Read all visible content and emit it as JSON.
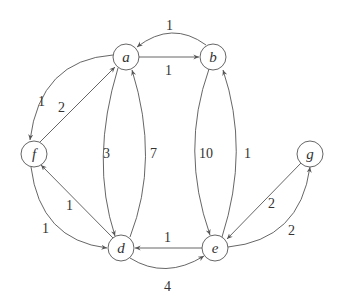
{
  "graph": {
    "type": "directed-weighted",
    "nodes": [
      {
        "id": "a",
        "label": "a",
        "x": 126,
        "y": 57
      },
      {
        "id": "b",
        "label": "b",
        "x": 213,
        "y": 57
      },
      {
        "id": "f",
        "label": "f",
        "x": 34,
        "y": 154
      },
      {
        "id": "g",
        "label": "g",
        "x": 310,
        "y": 154
      },
      {
        "id": "d",
        "label": "d",
        "x": 121,
        "y": 248
      },
      {
        "id": "e",
        "label": "e",
        "x": 215,
        "y": 248
      }
    ],
    "edges": [
      {
        "from": "b",
        "to": "a",
        "weight": "1"
      },
      {
        "from": "a",
        "to": "b",
        "weight": "1"
      },
      {
        "from": "a",
        "to": "f",
        "weight": "1"
      },
      {
        "from": "f",
        "to": "a",
        "weight": "2"
      },
      {
        "from": "a",
        "to": "d",
        "weight": "3"
      },
      {
        "from": "d",
        "to": "a",
        "weight": "7"
      },
      {
        "from": "b",
        "to": "e",
        "weight": "10"
      },
      {
        "from": "e",
        "to": "b",
        "weight": "1"
      },
      {
        "from": "d",
        "to": "f",
        "weight": "1"
      },
      {
        "from": "f",
        "to": "d",
        "weight": "1"
      },
      {
        "from": "e",
        "to": "d",
        "weight": "1"
      },
      {
        "from": "d",
        "to": "e",
        "weight": "4"
      },
      {
        "from": "g",
        "to": "e",
        "weight": "2"
      },
      {
        "from": "e",
        "to": "g",
        "weight": "2"
      }
    ]
  }
}
